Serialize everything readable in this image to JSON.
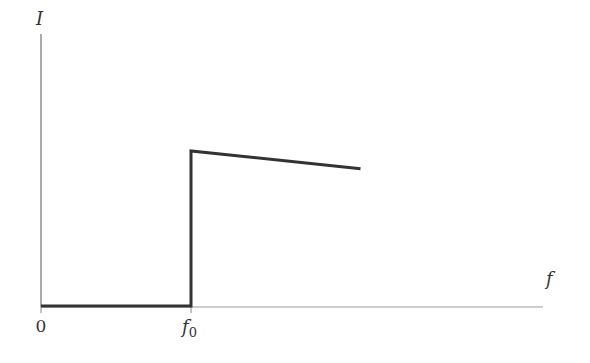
{
  "chart_data": {
    "type": "line",
    "title": "",
    "xlabel": "f",
    "ylabel": "I",
    "x_tick_labels": [
      "0",
      "f0"
    ],
    "x_tick_labels_display": {
      "origin": "0",
      "threshold_main": "f",
      "threshold_sub": "0"
    },
    "grid": false,
    "legend": null,
    "series": [
      {
        "name": "I(f)",
        "points": [
          {
            "x": 0,
            "y": 0
          },
          {
            "x": 1.0,
            "y": 0
          },
          {
            "x": 1.0,
            "y": 1.0
          },
          {
            "x": 2.13,
            "y": 0.885
          }
        ]
      }
    ],
    "xlim": [
      0,
      2.35
    ],
    "ylim": [
      0,
      1.75
    ],
    "colors": {
      "axis": "#888888",
      "line": "#333333",
      "text": "#333333"
    }
  },
  "labels": {
    "y_axis": "I",
    "x_axis": "f",
    "origin": "0",
    "threshold_main": "f",
    "threshold_sub": "0"
  }
}
